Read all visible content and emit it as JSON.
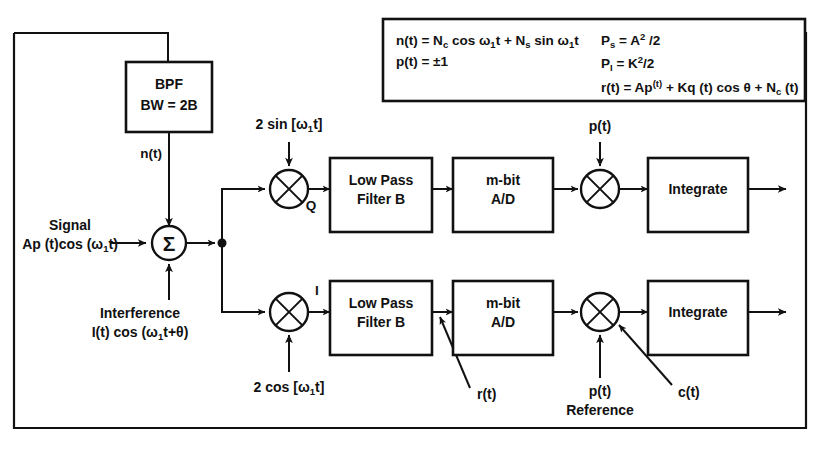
{
  "diagram": {
    "title_present": false,
    "frame": {
      "name": "outer-boundary"
    },
    "equation_box": {
      "left_column": [
        "n(t) = Nᴄ cos ω₁t + Nₛ sin ω₁t",
        "p(t) = ±1"
      ],
      "right_column": [
        "Pₛ = A² /2",
        "P₁ = K²/2",
        "r(t) = Ap(t) + Kq (t) cos θ + Nᴄ (t)"
      ],
      "parts": {
        "n_lhs": "n(t) = N",
        "n_sub_c": "c",
        "n_mid": " cos ω",
        "n_sub_1a": "1",
        "n_t1": "t + N",
        "n_sub_s": "s",
        "n_end": " sin ω",
        "n_sub_1b": "1",
        "n_t2": "t",
        "p_line": "p(t) = ±1",
        "ps_lhs": "P",
        "ps_sub": "s",
        "ps_rhs": " = A",
        "ps_sup": "2",
        "ps_tail": " /2",
        "pi_lhs": "P",
        "pi_sub": "I",
        "pi_rhs": " = K",
        "pi_sup": "2",
        "pi_tail": "/2",
        "r_lhs": "r(t) = Ap",
        "r_sup": "(t)",
        "r_mid": " + Kq (t) cos θ + N",
        "r_sub": "c",
        "r_tail": " (t)"
      }
    },
    "blocks": [
      {
        "id": "bpf",
        "line1": "BPF",
        "line2": "BW = 2B"
      },
      {
        "id": "lpf-q",
        "line1": "Low Pass",
        "line2": "Filter B"
      },
      {
        "id": "lpf-i",
        "line1": "Low Pass",
        "line2": "Filter B"
      },
      {
        "id": "ad-q",
        "line1": "m-bit",
        "line2": "A/D"
      },
      {
        "id": "ad-i",
        "line1": "m-bit",
        "line2": "A/D"
      },
      {
        "id": "integrate-q",
        "line1": "Integrate",
        "line2": ""
      },
      {
        "id": "integrate-i",
        "line1": "Integrate",
        "line2": ""
      }
    ],
    "summer": {
      "symbol": "Σ"
    },
    "labels": {
      "noise": "n(t)",
      "signal_line1": "Signal",
      "signal_line2_a": "Ap (t)cos (ω",
      "signal_line2_sub": "1",
      "signal_line2_b": "t)",
      "interference_line1": "Interference",
      "interference_line2_a": "I(t) cos (ω",
      "interference_line2_sub": "1",
      "interference_line2_b": "t+θ)",
      "lo_upper_a": "2 sin [ω",
      "lo_upper_sub": "1",
      "lo_upper_b": "t]",
      "lo_lower_a": "2 cos [ω",
      "lo_lower_sub": "1",
      "lo_lower_b": "t]",
      "branch_q": "Q",
      "branch_i": "I",
      "pn_top": "p(t)",
      "r_of_t": "r(t)",
      "pn_ref_line1": "p(t)",
      "pn_ref_line2": "Reference",
      "c_of_t": "c(t)"
    },
    "colors": {
      "ink": "#111111",
      "paper": "#ffffff"
    }
  }
}
